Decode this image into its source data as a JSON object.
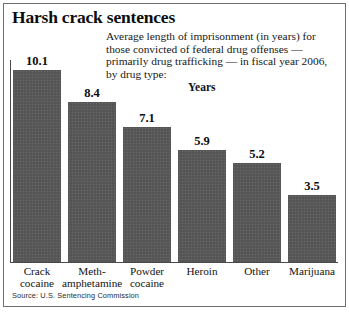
{
  "headline": "Harsh crack sentences",
  "subhead": "Average length of imprisonment (in years) for those convicted of federal drug offenses — primarily drug trafficking — in fiscal year 2006, by drug type:",
  "axis_label": "Years",
  "source": "Source: U.S. Sentencing Commission",
  "credit": "",
  "colors": {
    "bar": "#585858",
    "frame": "#6f6f6f",
    "axis": "#4a4a4a",
    "text": "#111111",
    "background": "#ffffff"
  },
  "chart_data": {
    "type": "bar",
    "title": "Harsh crack sentences",
    "subtitle": "Average length of imprisonment (in years) for those convicted of federal drug offenses — primarily drug trafficking — in fiscal year 2006, by drug type:",
    "xlabel": "",
    "ylabel": "Years",
    "ylim": [
      0,
      10.1
    ],
    "grid": false,
    "legend": false,
    "categories": [
      "Crack\ncocaine",
      "Meth-\namphetamine",
      "Powder\ncocaine",
      "Heroin",
      "Other",
      "Marijuana"
    ],
    "values": [
      10.1,
      8.4,
      7.1,
      5.9,
      5.2,
      3.5
    ],
    "value_labels": [
      "10.1",
      "8.4",
      "7.1",
      "5.9",
      "5.2",
      "3.5"
    ],
    "units": "years",
    "source": "U.S. Sentencing Commission"
  }
}
